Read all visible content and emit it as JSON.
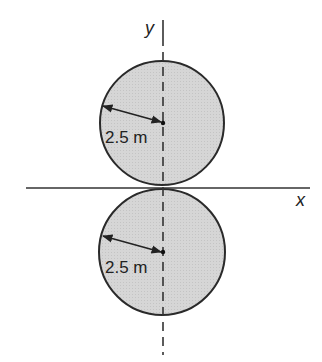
{
  "diagram": {
    "axes": {
      "x_label": "x",
      "y_label": "y"
    },
    "circles": [
      {
        "name": "upper-circle",
        "radius_label": "2.5 m"
      },
      {
        "name": "lower-circle",
        "radius_label": "2.5 m"
      }
    ],
    "colors": {
      "fill": "#d9d9d9",
      "stroke": "#2a2a2a",
      "background": "#ffffff"
    }
  }
}
